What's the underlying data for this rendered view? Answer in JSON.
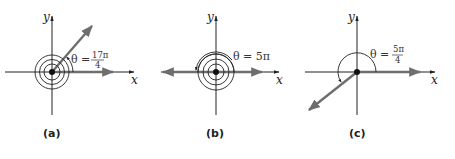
{
  "panels": [
    {
      "caption": "(a)",
      "x_label": "x",
      "y_label": "y",
      "theta_prefix": "θ =",
      "theta_num": "17π",
      "theta_den": "4",
      "angle_description": "17π/4 — two full rotations plus π/4"
    },
    {
      "caption": "(b)",
      "x_label": "x",
      "y_label": "y",
      "theta_prefix": "θ = 5π",
      "angle_description": "5π — two full rotations plus π"
    },
    {
      "caption": "(c)",
      "x_label": "x",
      "y_label": "y",
      "theta_prefix": "θ =",
      "theta_num": "5π",
      "theta_den": "4",
      "angle_description": "5π/4 — measured counterclockwise into third quadrant"
    }
  ],
  "colors": {
    "axis": "#222222",
    "ray": "#6e6e6e",
    "background": "#ffffff"
  }
}
